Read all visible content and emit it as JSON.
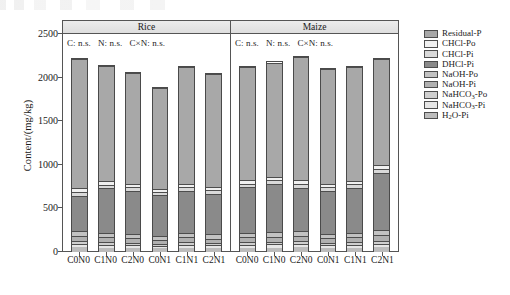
{
  "axes": {
    "y_title": "Content/(mg/kg)",
    "y_ticks": [
      "2500",
      "2000",
      "1500",
      "1000",
      "500",
      "0"
    ],
    "y_min": 0,
    "y_max": 2500
  },
  "panels": [
    {
      "name": "Rice",
      "stats": {
        "c": "C: n.s.",
        "n": "N: n.s.",
        "cn": "C×N: n.s."
      }
    },
    {
      "name": "Maize",
      "stats": {
        "c": "C: n.s.",
        "n": "N: n.s.",
        "cn": "C×N: n.s."
      }
    }
  ],
  "legend": {
    "items": [
      {
        "label": "Residual-P",
        "key": "residual_p",
        "color": "#a8a8a8"
      },
      {
        "label": "CHCl-Po",
        "key": "chcl_po",
        "color": "#f0f0f0"
      },
      {
        "label": "CHCl-Pi",
        "key": "chcl_pi",
        "color": "#d9d9d9"
      },
      {
        "label": "DHCl-Pi",
        "key": "dhcl_pi",
        "color": "#8a8a8a"
      },
      {
        "label": "NaOH-Po",
        "key": "naoh_po",
        "color": "#c2c2c2"
      },
      {
        "label": "NaOH-Pi",
        "key": "naoh_pi",
        "color": "#b0b0b0"
      },
      {
        "label": "NaHCO3-Po",
        "key": "nahco3_po",
        "color": "#cfcfcf",
        "sub": "3",
        "pre": "NaHCO",
        "post": "-Po"
      },
      {
        "label": "NaHCO3-Pi",
        "key": "nahco3_pi",
        "color": "#e6e6e6",
        "sub": "3",
        "pre": "NaHCO",
        "post": "-Pi"
      },
      {
        "label": "H2O-Pi",
        "key": "h2o_pi",
        "color": "#bcbcbc",
        "sub": "2",
        "pre": "H",
        "post": "O-Pi"
      }
    ]
  },
  "chart_data": {
    "type": "bar",
    "subtype": "stacked",
    "title": "",
    "xlabel": "",
    "ylabel": "Content/(mg/kg)",
    "ylim": [
      0,
      2500
    ],
    "grid": false,
    "legend_position": "right",
    "panel_labels": [
      "Rice",
      "Maize"
    ],
    "categories": [
      "C0N0",
      "C1N0",
      "C2N0",
      "C0N1",
      "C1N1",
      "C2N1"
    ],
    "stack_order_bottom_to_top": [
      "H2O-Pi",
      "NaHCO3-Pi",
      "NaHCO3-Po",
      "NaOH-Pi",
      "NaOH-Po",
      "DHCl-Pi",
      "CHCl-Pi",
      "CHCl-Po",
      "Residual-P"
    ],
    "panels": [
      {
        "name": "Rice",
        "annotation": "C: n.s.   N: n.s.   C×N: n.s.",
        "totals": [
          2225,
          2145,
          2065,
          1895,
          2130,
          2055
        ],
        "series": [
          {
            "name": "H2O-Pi",
            "values": [
              55,
              50,
              48,
              42,
              50,
              46
            ]
          },
          {
            "name": "NaHCO3-Pi",
            "values": [
              38,
              34,
              32,
              28,
              34,
              32
            ]
          },
          {
            "name": "NaHCO3-Po",
            "values": [
              30,
              28,
              26,
              24,
              28,
              26
            ]
          },
          {
            "name": "NaOH-Pi",
            "values": [
              60,
              56,
              52,
              48,
              56,
              52
            ]
          },
          {
            "name": "NaOH-Po",
            "values": [
              55,
              50,
              48,
              44,
              50,
              48
            ]
          },
          {
            "name": "DHCl-Pi",
            "values": [
              410,
              515,
              500,
              470,
              490,
              470
            ]
          },
          {
            "name": "CHCl-Pi",
            "values": [
              48,
              42,
              40,
              36,
              42,
              40
            ]
          },
          {
            "name": "CHCl-Po",
            "values": [
              44,
              40,
              38,
              34,
              40,
              38
            ]
          },
          {
            "name": "Residual-P",
            "values": [
              1485,
              1330,
              1281,
              1169,
              1340,
              1303
            ]
          }
        ]
      },
      {
        "name": "Maize",
        "annotation": "C: n.s.   N: n.s.   C×N: n.s.",
        "totals": [
          2135,
          2185,
          2245,
          2110,
          2130,
          2225
        ],
        "series": [
          {
            "name": "H2O-Pi",
            "values": [
              50,
              52,
              54,
              48,
              50,
              58
            ]
          },
          {
            "name": "NaHCO3-Pi",
            "values": [
              34,
              36,
              38,
              32,
              34,
              40
            ]
          },
          {
            "name": "NaHCO3-Po",
            "values": [
              28,
              30,
              32,
              26,
              28,
              34
            ]
          },
          {
            "name": "NaOH-Pi",
            "values": [
              56,
              58,
              60,
              52,
              56,
              64
            ]
          },
          {
            "name": "NaOH-Po",
            "values": [
              50,
              52,
              54,
              48,
              50,
              58
            ]
          },
          {
            "name": "DHCl-Pi",
            "values": [
              530,
              555,
              500,
              500,
              520,
              660
            ]
          },
          {
            "name": "CHCl-Pi",
            "values": [
              42,
              44,
              46,
              40,
              42,
              48
            ]
          },
          {
            "name": "CHCl-Po",
            "values": [
              40,
              42,
              44,
              38,
              40,
              46
            ]
          },
          {
            "name": "Residual-P",
            "values": [
              1305,
              1316,
              1417,
              1326,
              1310,
              1217
            ]
          }
        ]
      }
    ]
  }
}
